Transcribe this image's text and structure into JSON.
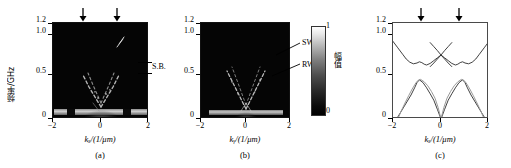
{
  "figure": {
    "caption_parts": [
      "(a)",
      "(b)",
      "(c)"
    ],
    "colors": {
      "heat_bg": "#050505",
      "curve_dark": "#2b2b2b",
      "curve_light": "#9a9a9a",
      "axis": "#000000"
    }
  },
  "panels": [
    {
      "id": "a",
      "label": "(a)",
      "type": "heatmap",
      "ylabel": "频率/GHz",
      "xlabel": "kₓ/(1/μm)",
      "yticks": [
        "0",
        "0.5",
        "1.0",
        "1.2"
      ],
      "ytick_values": [
        0,
        0.5,
        1.0,
        1.2
      ],
      "xticks": [
        "−2",
        "0",
        "2"
      ],
      "xtick_values": [
        -2,
        0,
        2
      ],
      "ylim": [
        0,
        1.2
      ],
      "xlim": [
        -2,
        2
      ],
      "annotations": [
        {
          "text": "S.B.",
          "freq_low": 0.52,
          "freq_high": 0.68
        }
      ],
      "arrows": [
        {
          "x_value": -0.72
        },
        {
          "x_value": 0.72
        }
      ]
    },
    {
      "id": "b",
      "label": "(b)",
      "type": "heatmap",
      "ylabel": "",
      "xlabel": "kᵧ/(1/μm)",
      "yticks": [
        "0",
        "0.5",
        "1.0",
        "1.2"
      ],
      "ytick_values": [
        0,
        0.5,
        1.0,
        1.2
      ],
      "xticks": [
        "−2",
        "0",
        "2"
      ],
      "xtick_values": [
        -2,
        0,
        2
      ],
      "ylim": [
        0,
        1.2
      ],
      "xlim": [
        -2,
        2
      ],
      "annotations": [
        {
          "text": "SW",
          "freq": 0.86,
          "k_value": 1.05
        },
        {
          "text": "RW",
          "freq": 0.56,
          "k_value": 0.72
        }
      ],
      "arrows": []
    },
    {
      "id": "c",
      "label": "(c)",
      "type": "line",
      "ylabel": "",
      "xlabel": "kₓ/(1/μm)",
      "yticks": [
        "0",
        "0.5",
        "1.0",
        "1.2"
      ],
      "ytick_values": [
        0,
        0.5,
        1.0,
        1.2
      ],
      "xticks": [
        "−2",
        "0",
        "2"
      ],
      "xtick_values": [
        -2,
        0,
        2
      ],
      "ylim": [
        0,
        1.2
      ],
      "xlim": [
        -2,
        2
      ],
      "annotations": [],
      "arrows": [
        {
          "x_value": -0.78
        },
        {
          "x_value": 0.8
        }
      ]
    }
  ],
  "colorbar": {
    "label": "幅值",
    "tick_top": "1",
    "tick_bottom": "0",
    "range": [
      0,
      1
    ]
  },
  "chart_data": {
    "type": "line",
    "title": "",
    "xlabel": "kₓ/(1/μm)",
    "ylabel": "频率/GHz",
    "xlim": [
      -2,
      2
    ],
    "ylim": [
      0,
      1.2
    ],
    "grid": false,
    "legend": null,
    "panel": "(c)",
    "series": [
      {
        "name": "upper band",
        "color": "#2b2b2b",
        "x": [
          -2.0,
          -1.8,
          -1.6,
          -1.45,
          -1.3,
          -1.15,
          -1.0,
          -0.9,
          -0.8,
          -0.7,
          -0.6,
          -0.45,
          -0.3,
          -0.15,
          0.0,
          0.15,
          0.3,
          0.45,
          0.6,
          0.7,
          0.8,
          0.9,
          1.0,
          1.15,
          1.3,
          1.45,
          1.6,
          1.8,
          2.0
        ],
        "y": [
          0.97,
          0.89,
          0.81,
          0.75,
          0.71,
          0.69,
          0.7,
          0.715,
          0.705,
          0.685,
          0.675,
          0.695,
          0.73,
          0.765,
          0.8,
          0.765,
          0.73,
          0.695,
          0.675,
          0.685,
          0.705,
          0.715,
          0.7,
          0.69,
          0.71,
          0.75,
          0.81,
          0.89,
          0.97
        ]
      },
      {
        "name": "upper band crossing",
        "color": "#2b2b2b",
        "x": [
          -0.45,
          -0.3,
          -0.15,
          0.0,
          0.15,
          0.3,
          0.45
        ],
        "y": [
          0.655,
          0.7,
          0.75,
          0.8,
          0.855,
          0.905,
          0.955
        ]
      },
      {
        "name": "upper band crossing mirror",
        "color": "#2b2b2b",
        "x": [
          -0.45,
          -0.3,
          -0.15,
          0.0,
          0.15,
          0.3,
          0.45
        ],
        "y": [
          0.955,
          0.905,
          0.855,
          0.8,
          0.75,
          0.7,
          0.655
        ]
      },
      {
        "name": "lower band dark",
        "color": "#2b2b2b",
        "x": [
          -1.85,
          -1.7,
          -1.55,
          -1.4,
          -1.25,
          -1.1,
          -1.0,
          -0.9,
          -0.75,
          -0.6,
          -0.45,
          -0.3,
          -0.15,
          0.0,
          0.15,
          0.3,
          0.45,
          0.6,
          0.75,
          0.9,
          1.0,
          1.1,
          1.25,
          1.4,
          1.55,
          1.7,
          1.85
        ],
        "y": [
          0.0,
          0.075,
          0.15,
          0.225,
          0.3,
          0.39,
          0.455,
          0.49,
          0.455,
          0.39,
          0.315,
          0.235,
          0.12,
          0.0,
          0.12,
          0.235,
          0.315,
          0.39,
          0.455,
          0.49,
          0.455,
          0.39,
          0.3,
          0.225,
          0.15,
          0.075,
          0.0
        ]
      },
      {
        "name": "lower band light",
        "color": "#9a9a9a",
        "x": [
          -1.8,
          -1.65,
          -1.5,
          -1.35,
          -1.2,
          -1.05,
          -0.95,
          -0.85,
          -0.7,
          -0.55,
          -0.4,
          -0.25,
          -0.12,
          0.0,
          0.12,
          0.25,
          0.4,
          0.55,
          0.7,
          0.85,
          0.95,
          1.05,
          1.2,
          1.35,
          1.5,
          1.65,
          1.8
        ],
        "y": [
          0.0,
          0.105,
          0.2,
          0.29,
          0.375,
          0.45,
          0.485,
          0.495,
          0.465,
          0.415,
          0.345,
          0.26,
          0.145,
          0.0,
          0.145,
          0.26,
          0.345,
          0.415,
          0.465,
          0.495,
          0.485,
          0.45,
          0.375,
          0.29,
          0.2,
          0.105,
          0.0
        ]
      }
    ]
  }
}
